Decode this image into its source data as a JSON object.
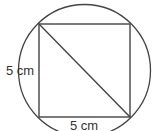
{
  "diagram": {
    "stroke_color": "#444444",
    "background": "#ffffff",
    "circle": {
      "cx": 84.5,
      "cy": 70.5,
      "r": 66
    },
    "square": {
      "x": 39,
      "y": 24,
      "width": 91,
      "height": 93
    },
    "diagonal": {
      "x1": 39,
      "y1": 24,
      "x2": 130,
      "y2": 117
    },
    "labels": {
      "side_left": "5 cm",
      "side_bottom": "5 cm"
    }
  }
}
